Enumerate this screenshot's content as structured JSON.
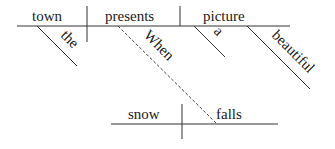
{
  "diagram": {
    "type": "sentence-diagram",
    "main_clause": {
      "subject": "town",
      "verb": "presents",
      "object": "picture",
      "subject_modifiers": [
        "the"
      ],
      "object_modifiers": [
        "a",
        "beautiful"
      ]
    },
    "subordinate_clause": {
      "connector": "When",
      "subject": "snow",
      "verb": "falls"
    },
    "colors": {
      "line": "#333333",
      "text": "#1a1a1a",
      "background": "#ffffff"
    }
  }
}
